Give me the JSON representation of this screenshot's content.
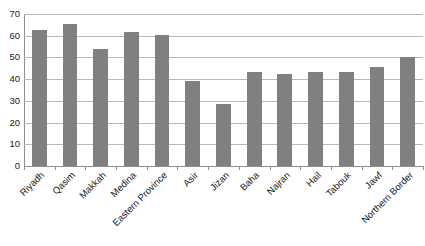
{
  "chart_data": {
    "type": "bar",
    "title": "",
    "subtitle": "",
    "xlabel": "",
    "ylabel": "",
    "ylim": [
      0,
      70
    ],
    "ytick_step": 10,
    "yticks": [
      70,
      60,
      50,
      40,
      30,
      20,
      10,
      0
    ],
    "grid": "horizontal",
    "legend": "none",
    "bar_color": "#808080",
    "gridline_color": "#b9b9b9",
    "axis_color": "#8f8f8f",
    "categories": [
      "Riyadh",
      "Qasim",
      "Makkah",
      "Medina",
      "Eastern Province",
      "Asir",
      "Jizan",
      "Baha",
      "Najran",
      "Hail",
      "Tabouk",
      "Jawf",
      "Northern Border"
    ],
    "values": [
      62.5,
      65.5,
      54,
      61.5,
      60.5,
      39,
      28.5,
      43.5,
      42.5,
      43.5,
      43.5,
      45.5,
      50
    ]
  }
}
